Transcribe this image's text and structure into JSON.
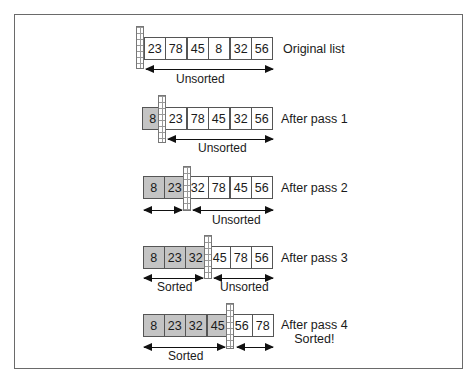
{
  "diagram": {
    "type": "selection-sort-passes",
    "colors": {
      "sorted_fill": "#c4c4c4",
      "unsorted_fill": "#ffffff",
      "border": "#555555",
      "arrow": "#111111"
    },
    "rows": [
      {
        "label": "Original list",
        "sublabel": "",
        "values": [
          "23",
          "78",
          "45",
          "8",
          "32",
          "56"
        ],
        "sorted_count": 0,
        "spans": [
          {
            "label": "Unsorted",
            "kind": "unsorted"
          }
        ]
      },
      {
        "label": "After pass 1",
        "sublabel": "",
        "values": [
          "8",
          "23",
          "78",
          "45",
          "32",
          "56"
        ],
        "sorted_count": 1,
        "spans": [
          {
            "label": "Unsorted",
            "kind": "unsorted"
          }
        ]
      },
      {
        "label": "After pass 2",
        "sublabel": "",
        "values": [
          "8",
          "23",
          "32",
          "78",
          "45",
          "56"
        ],
        "sorted_count": 2,
        "spans": [
          {
            "label": "",
            "kind": "sorted"
          },
          {
            "label": "Unsorted",
            "kind": "unsorted"
          }
        ]
      },
      {
        "label": "After pass 3",
        "sublabel": "",
        "values": [
          "8",
          "23",
          "32",
          "45",
          "78",
          "56"
        ],
        "sorted_count": 3,
        "spans": [
          {
            "label": "Sorted",
            "kind": "sorted"
          },
          {
            "label": "Unsorted",
            "kind": "unsorted"
          }
        ]
      },
      {
        "label": "After pass 4",
        "sublabel": "Sorted!",
        "values": [
          "8",
          "23",
          "32",
          "45",
          "56",
          "78"
        ],
        "sorted_count": 4,
        "spans": [
          {
            "label": "Sorted",
            "kind": "sorted"
          },
          {
            "label": "",
            "kind": "unsorted"
          }
        ]
      }
    ]
  }
}
